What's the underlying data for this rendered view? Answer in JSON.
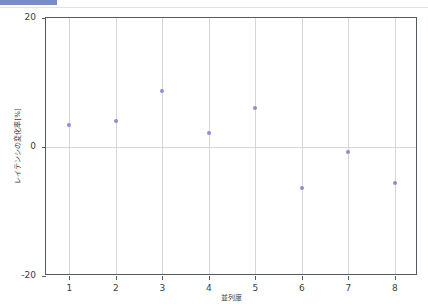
{
  "window": {
    "accent_color": "#7a8cc4"
  },
  "chart_data": {
    "type": "scatter",
    "title": "",
    "xlabel": "並列度",
    "ylabel": "レイテンシの変化率[%]",
    "x": [
      1,
      2,
      3,
      4,
      5,
      6,
      7,
      8
    ],
    "values": [
      3.4,
      4.0,
      8.7,
      2.1,
      6.1,
      -6.3,
      -0.7,
      -5.6
    ],
    "series": [
      {
        "name": "レイテンシの変化率",
        "values": [
          3.4,
          4.0,
          8.7,
          2.1,
          6.1,
          -6.3,
          -0.7,
          -5.6
        ],
        "color": "#8a8fcf",
        "marker": "circle"
      }
    ],
    "xlim": [
      0.5,
      8.5
    ],
    "ylim": [
      -20,
      20
    ],
    "xticks": [
      1,
      2,
      3,
      4,
      5,
      6,
      7,
      8
    ],
    "xtick_labels": [
      "1",
      "2",
      "3",
      "4",
      "5",
      "6",
      "7",
      "8"
    ],
    "yticks": [
      -20,
      0,
      20
    ],
    "ytick_labels": [
      "-20",
      "0",
      "20"
    ],
    "grid": {
      "vertical": true,
      "horizontal_at_zero": true,
      "color": "#d6d6d8"
    },
    "legend": null,
    "annotations": []
  }
}
